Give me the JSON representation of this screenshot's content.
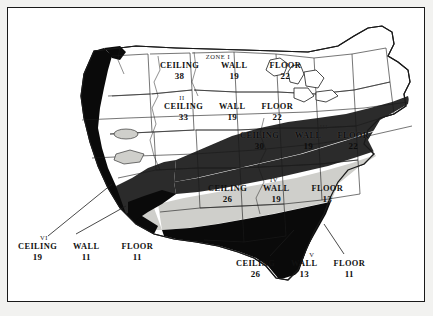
{
  "figure": {
    "kind": "insulation-r-value-zone-map",
    "region": "United States"
  },
  "legend_terms": {
    "ceiling": "CEILING",
    "wall": "WALL",
    "floor": "FLOOR"
  },
  "zones": [
    {
      "id": "zone-1",
      "heading": "ZONE I",
      "roman": "I",
      "ceiling": "38",
      "wall": "19",
      "floor": "22",
      "fill": "#ffffff",
      "fill_name": "white"
    },
    {
      "id": "zone-2",
      "heading": "II",
      "roman": "II",
      "ceiling": "33",
      "wall": "19",
      "floor": "22",
      "fill": "#ffffff",
      "fill_name": "white"
    },
    {
      "id": "zone-3",
      "heading": "III",
      "roman": "III",
      "ceiling": "30",
      "wall": "19",
      "floor": "22",
      "fill": "#2b2b2b",
      "fill_name": "dark-gray"
    },
    {
      "id": "zone-4",
      "heading": "IV",
      "roman": "IV",
      "ceiling": "26",
      "wall": "19",
      "floor": "13",
      "fill": "#cfcfcb",
      "fill_name": "light-gray"
    },
    {
      "id": "zone-5",
      "heading": "V",
      "roman": "V",
      "ceiling": "26",
      "wall": "13",
      "floor": "11",
      "fill": "#0a0a0a",
      "fill_name": "black"
    },
    {
      "id": "zone-6",
      "heading": "VI",
      "roman": "VI",
      "ceiling": "19",
      "wall": "11",
      "floor": "11",
      "fill": "#0a0a0a",
      "fill_name": "black"
    }
  ],
  "colors": {
    "frame": "#1a1a1a",
    "page": "#f2f2f0",
    "plate": "#ffffff",
    "outline": "#1a1a1a",
    "band_dark": "#2b2b2b",
    "band_light": "#cfcfcb",
    "band_black": "#0a0a0a",
    "text": "#111111"
  }
}
